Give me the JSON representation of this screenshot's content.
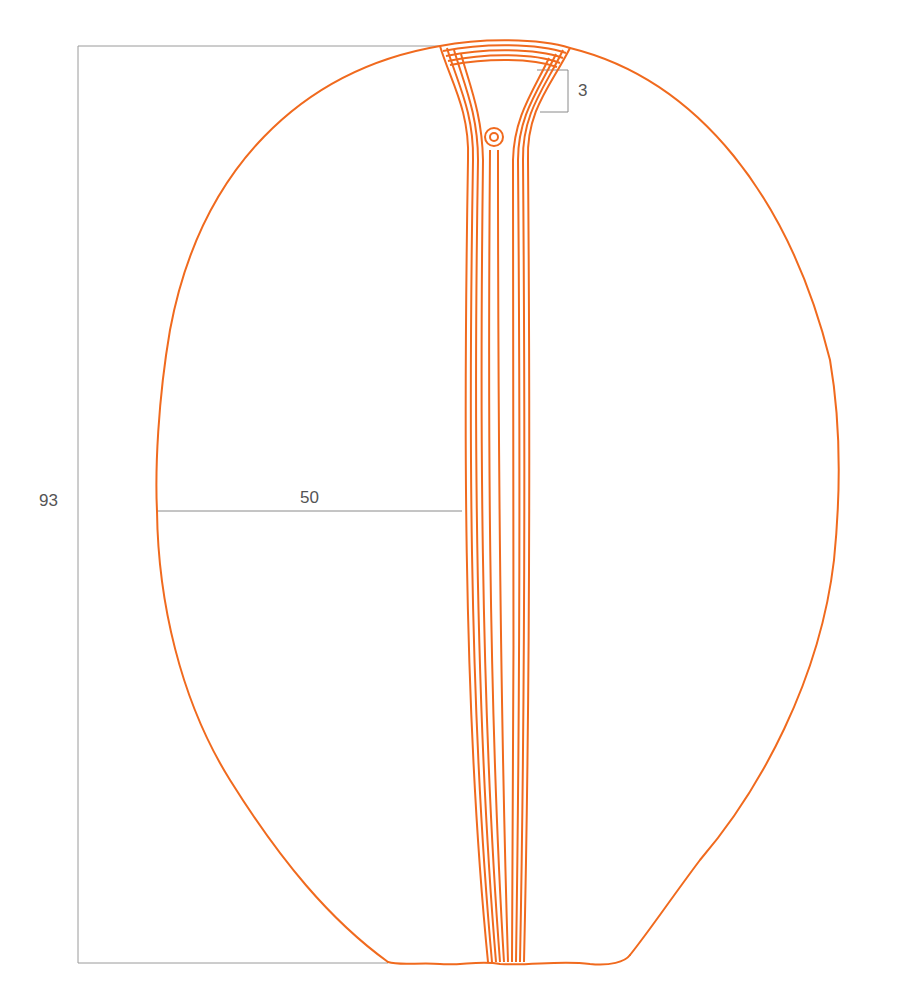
{
  "diagram": {
    "stroke_color": "#f06a1e",
    "dimension_line_color": "#9a9a9a",
    "label_color": "#555555",
    "dimensions": {
      "total_height": {
        "label": "93"
      },
      "half_width": {
        "label": "50"
      },
      "top_band": {
        "label": "3"
      }
    }
  }
}
